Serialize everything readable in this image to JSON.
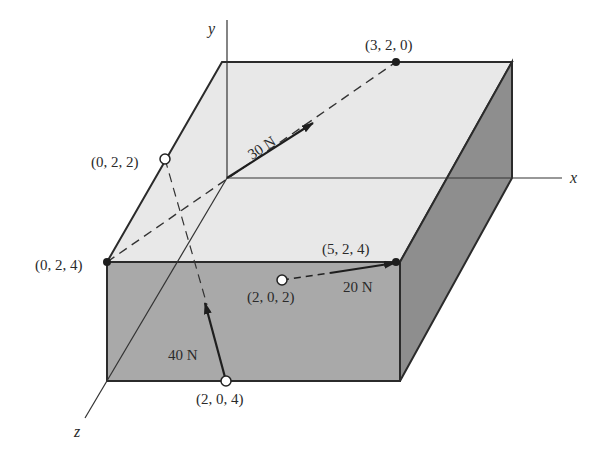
{
  "figure": {
    "type": "3D force diagram on rectangular block",
    "axes": {
      "x_label": "x",
      "y_label": "y",
      "z_label": "z"
    },
    "points": [
      {
        "id": "p320",
        "label": "(3, 2, 0)",
        "marker": "filled"
      },
      {
        "id": "p022",
        "label": "(0, 2, 2)",
        "marker": "open"
      },
      {
        "id": "p024",
        "label": "(0, 2, 4)",
        "marker": "filled"
      },
      {
        "id": "p524",
        "label": "(5, 2, 4)",
        "marker": "filled"
      },
      {
        "id": "p202",
        "label": "(2, 0, 2)",
        "marker": "open"
      },
      {
        "id": "p204",
        "label": "(2, 0, 4)",
        "marker": "open"
      }
    ],
    "forces": [
      {
        "id": "f30",
        "label": "30 N",
        "from": "(0, 0, 0)",
        "toward": "(3, 2, 0)"
      },
      {
        "id": "f20",
        "label": "20 N",
        "from": "(2, 0, 2)",
        "toward": "(5, 2, 4)"
      },
      {
        "id": "f40",
        "label": "40 N",
        "from": "(2, 0, 4)",
        "toward": "(0, 2, 2)"
      }
    ],
    "colors": {
      "top_face": "#e8e8e8",
      "front_face": "#a9a9a9",
      "right_face": "#8e8e8e",
      "stroke": "#2b2b2b"
    }
  }
}
